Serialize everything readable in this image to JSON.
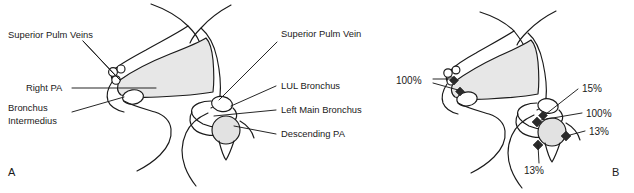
{
  "figure": {
    "panels": [
      {
        "id": "A",
        "letter": "A",
        "kind": "anatomy-labels",
        "labels_left": [
          {
            "name": "superior-pulm-veins",
            "text": "Superior Pulm Veins",
            "lines": [
              "Superior Pulm Veins"
            ]
          },
          {
            "name": "right-pa",
            "text": "Right PA",
            "lines": [
              "Right PA"
            ]
          },
          {
            "name": "bronchus-intermedius",
            "text": "Bronchus Intermedius",
            "lines": [
              "Bronchus",
              "Intermedius"
            ]
          }
        ],
        "labels_right": [
          {
            "name": "superior-pulm-vein",
            "text": "Superior Pulm Vein",
            "lines": [
              "Superior Pulm Vein"
            ]
          },
          {
            "name": "lul-bronchus",
            "text": "LUL Bronchus",
            "lines": [
              "LUL Bronchus"
            ]
          },
          {
            "name": "left-main-bronchus",
            "text": "Left Main Bronchus",
            "lines": [
              "Left Main Bronchus"
            ]
          },
          {
            "name": "descending-pa",
            "text": "Descending PA",
            "lines": [
              "Descending PA"
            ]
          }
        ]
      },
      {
        "id": "B",
        "letter": "B",
        "kind": "anatomy-percentages",
        "percentages": [
          {
            "name": "pct-right-100",
            "value": "100%",
            "side": "left",
            "targets": 2
          },
          {
            "name": "pct-lul-15",
            "value": "15%",
            "side": "right",
            "targets": 1
          },
          {
            "name": "pct-left-main-100",
            "value": "100%",
            "side": "right",
            "targets": 1
          },
          {
            "name": "pct-descending-pa-13-right",
            "value": "13%",
            "side": "right",
            "targets": 1
          },
          {
            "name": "pct-descending-pa-13-bottom",
            "value": "13%",
            "side": "bottom",
            "targets": 1
          }
        ]
      }
    ],
    "colors": {
      "ink": "#1a1a1a",
      "background": "#ffffff",
      "shade_fill": "#e7e7e7",
      "node_dark": "#2b2b2b"
    }
  }
}
